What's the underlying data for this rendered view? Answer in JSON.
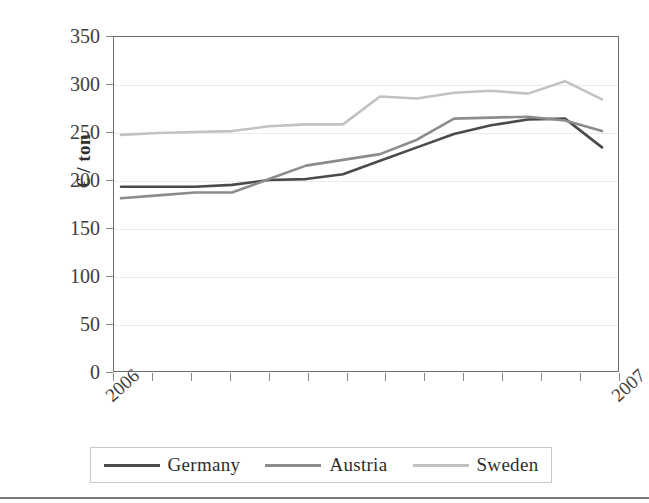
{
  "chart_data": {
    "type": "line",
    "title": "",
    "subtitle": "",
    "xlabel": "",
    "ylabel": "€ / ton",
    "ylim": [
      0,
      350
    ],
    "yticks": [
      0,
      50,
      100,
      150,
      200,
      250,
      300,
      350
    ],
    "ytick_labels": [
      "0",
      "50",
      "100",
      "150",
      "200",
      "250",
      "300",
      "350"
    ],
    "grid": true,
    "grid_axis": "y",
    "legend_position": "bottom",
    "x_tick_count": 14,
    "x": [
      0,
      1,
      2,
      3,
      4,
      5,
      6,
      7,
      8,
      9,
      10,
      11,
      12,
      13
    ],
    "xtick_labels": [
      "2006",
      "",
      "",
      "",
      "",
      "",
      "",
      "",
      "",
      "",
      "",
      "",
      "",
      "2007"
    ],
    "x_labeled_ticks": [
      {
        "index": 0,
        "label": "2006"
      },
      {
        "index": 13,
        "label": "2007"
      }
    ],
    "series": [
      {
        "name": "Germany",
        "color": "#4a4a4a",
        "values": [
          194,
          194,
          194,
          196,
          201,
          202,
          207,
          221,
          235,
          249,
          258,
          264,
          265,
          235
        ]
      },
      {
        "name": "Austria",
        "color": "#8c8c8c",
        "values": [
          182,
          185,
          188,
          188,
          202,
          216,
          222,
          228,
          243,
          265,
          266,
          267,
          263,
          252
        ]
      },
      {
        "name": "Sweden",
        "color": "#c2c2c2",
        "values": [
          248,
          250,
          251,
          252,
          257,
          259,
          259,
          288,
          286,
          292,
          294,
          291,
          304,
          285
        ]
      }
    ]
  },
  "legend": {
    "items": [
      {
        "label": "Germany",
        "color": "#4a4a4a"
      },
      {
        "label": "Austria",
        "color": "#8c8c8c"
      },
      {
        "label": "Sweden",
        "color": "#c2c2c2"
      }
    ]
  },
  "axes": {
    "y_title": "€ / ton"
  },
  "colors": {
    "frame": "#6d6d6d",
    "gridline": "#ececec",
    "tick": "#8a8a8a",
    "text": "#3d3d3d",
    "germany": "#4a4a4a",
    "austria": "#8c8c8c",
    "sweden": "#c2c2c2"
  }
}
